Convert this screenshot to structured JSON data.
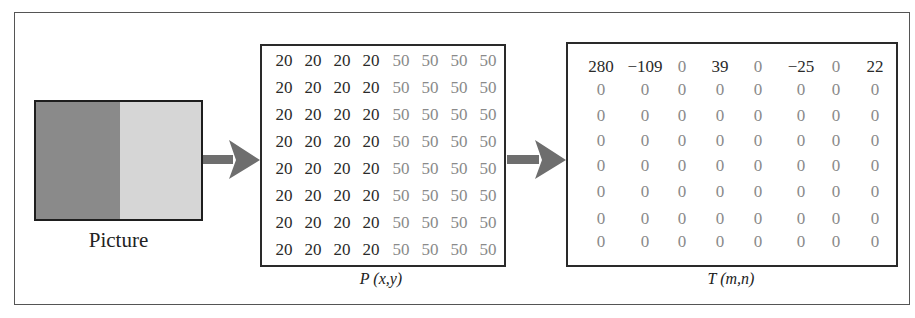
{
  "picture": {
    "label": "Picture",
    "left_color": "#8a8a8a",
    "right_color": "#d6d6d6"
  },
  "arrows": [
    {
      "from": "picture",
      "to": "P",
      "color": "#6e6e6e"
    },
    {
      "from": "P",
      "to": "T",
      "color": "#6e6e6e"
    }
  ],
  "P": {
    "caption_func": "P",
    "caption_args": "(x,y)",
    "dark_value_color": "#2a2a2a",
    "light_value_color": "#8a8a8a",
    "rows": [
      [
        "20",
        "20",
        "20",
        "20",
        "50",
        "50",
        "50",
        "50"
      ],
      [
        "20",
        "20",
        "20",
        "20",
        "50",
        "50",
        "50",
        "50"
      ],
      [
        "20",
        "20",
        "20",
        "20",
        "50",
        "50",
        "50",
        "50"
      ],
      [
        "20",
        "20",
        "20",
        "20",
        "50",
        "50",
        "50",
        "50"
      ],
      [
        "20",
        "20",
        "20",
        "20",
        "50",
        "50",
        "50",
        "50"
      ],
      [
        "20",
        "20",
        "20",
        "20",
        "50",
        "50",
        "50",
        "50"
      ],
      [
        "20",
        "20",
        "20",
        "20",
        "50",
        "50",
        "50",
        "50"
      ],
      [
        "20",
        "20",
        "20",
        "20",
        "50",
        "50",
        "50",
        "50"
      ]
    ]
  },
  "T": {
    "caption_func": "T",
    "caption_args": "(m,n)",
    "rows": [
      [
        "280",
        "−109",
        "0",
        "39",
        "0",
        "−25",
        "0",
        "22"
      ],
      [
        "0",
        "0",
        "0",
        "0",
        "0",
        "0",
        "0",
        "0"
      ],
      [
        "0",
        "0",
        "0",
        "0",
        "0",
        "0",
        "0",
        "0"
      ],
      [
        "0",
        "0",
        "0",
        "0",
        "0",
        "0",
        "0",
        "0"
      ],
      [
        "0",
        "0",
        "0",
        "0",
        "0",
        "0",
        "0",
        "0"
      ],
      [
        "0",
        "0",
        "0",
        "0",
        "0",
        "0",
        "0",
        "0"
      ],
      [
        "0",
        "0",
        "0",
        "0",
        "0",
        "0",
        "0",
        "0"
      ],
      [
        "0",
        "0",
        "0",
        "0",
        "0",
        "0",
        "0",
        "0"
      ]
    ]
  }
}
